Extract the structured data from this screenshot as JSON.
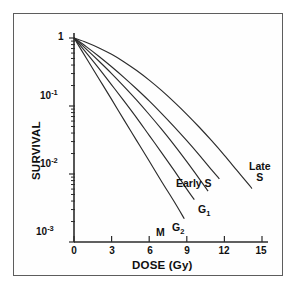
{
  "chart_data": {
    "type": "line",
    "title": "",
    "xlabel": "DOSE (Gy)",
    "ylabel": "SURVIVAL",
    "xlim": [
      0,
      15.6
    ],
    "ylim": [
      0.001,
      1
    ],
    "yscale": "log",
    "xscale": "linear",
    "grid": false,
    "legend": "inline-annotations",
    "xticks": [
      "0",
      "3",
      "6",
      "9",
      "12",
      "15"
    ],
    "xtick_values": [
      0,
      3,
      6,
      9,
      12,
      15
    ],
    "yticks": [
      "1",
      "10-1",
      "10-2",
      "10-3"
    ],
    "ytick_values": [
      1,
      0.1,
      0.01,
      0.001
    ],
    "ytick_mantissa": [
      "1",
      "10",
      "10",
      "10"
    ],
    "ytick_exponent": [
      "",
      "-1",
      "-2",
      "-3"
    ],
    "series": [
      {
        "name": "M",
        "label": "M",
        "points": [
          {
            "x": 0.0,
            "y": 1.0
          },
          {
            "x": 1.0,
            "y": 0.5
          },
          {
            "x": 2.0,
            "y": 0.25
          },
          {
            "x": 3.0,
            "y": 0.125
          },
          {
            "x": 4.0,
            "y": 0.062
          },
          {
            "x": 5.0,
            "y": 0.031
          },
          {
            "x": 6.0,
            "y": 0.0155
          },
          {
            "x": 7.0,
            "y": 0.0077
          },
          {
            "x": 8.0,
            "y": 0.0039
          },
          {
            "x": 8.8,
            "y": 0.0022
          }
        ]
      },
      {
        "name": "G2",
        "label": "G2",
        "points": [
          {
            "x": 0.0,
            "y": 1.0
          },
          {
            "x": 1.0,
            "y": 0.6
          },
          {
            "x": 2.0,
            "y": 0.355
          },
          {
            "x": 3.0,
            "y": 0.205
          },
          {
            "x": 4.0,
            "y": 0.118
          },
          {
            "x": 5.0,
            "y": 0.067
          },
          {
            "x": 6.0,
            "y": 0.037
          },
          {
            "x": 7.0,
            "y": 0.0205
          },
          {
            "x": 8.0,
            "y": 0.0112
          },
          {
            "x": 9.0,
            "y": 0.006
          },
          {
            "x": 9.6,
            "y": 0.0042
          }
        ]
      },
      {
        "name": "G1",
        "label": "G1",
        "points": [
          {
            "x": 0.0,
            "y": 1.0
          },
          {
            "x": 1.0,
            "y": 0.68
          },
          {
            "x": 2.0,
            "y": 0.455
          },
          {
            "x": 3.0,
            "y": 0.3
          },
          {
            "x": 4.0,
            "y": 0.193
          },
          {
            "x": 5.0,
            "y": 0.122
          },
          {
            "x": 6.0,
            "y": 0.075
          },
          {
            "x": 7.0,
            "y": 0.0452
          },
          {
            "x": 8.0,
            "y": 0.0266
          },
          {
            "x": 9.0,
            "y": 0.0152
          },
          {
            "x": 10.0,
            "y": 0.0085
          },
          {
            "x": 10.7,
            "y": 0.0056
          }
        ]
      },
      {
        "name": "Early S",
        "label": "Early S",
        "points": [
          {
            "x": 0.0,
            "y": 1.0
          },
          {
            "x": 1.0,
            "y": 0.74
          },
          {
            "x": 2.0,
            "y": 0.535
          },
          {
            "x": 3.0,
            "y": 0.378
          },
          {
            "x": 4.0,
            "y": 0.262
          },
          {
            "x": 5.0,
            "y": 0.178
          },
          {
            "x": 6.0,
            "y": 0.119
          },
          {
            "x": 7.0,
            "y": 0.0775
          },
          {
            "x": 8.0,
            "y": 0.0495
          },
          {
            "x": 9.0,
            "y": 0.031
          },
          {
            "x": 10.0,
            "y": 0.019
          },
          {
            "x": 11.0,
            "y": 0.0114
          },
          {
            "x": 11.6,
            "y": 0.0085
          }
        ]
      },
      {
        "name": "Late S",
        "label": "Late S",
        "points": [
          {
            "x": 0.0,
            "y": 1.0
          },
          {
            "x": 1.0,
            "y": 0.86
          },
          {
            "x": 2.0,
            "y": 0.715
          },
          {
            "x": 3.0,
            "y": 0.575
          },
          {
            "x": 4.0,
            "y": 0.445
          },
          {
            "x": 5.0,
            "y": 0.332
          },
          {
            "x": 6.0,
            "y": 0.24
          },
          {
            "x": 7.0,
            "y": 0.168
          },
          {
            "x": 8.0,
            "y": 0.114
          },
          {
            "x": 9.0,
            "y": 0.0755
          },
          {
            "x": 10.0,
            "y": 0.0487
          },
          {
            "x": 11.0,
            "y": 0.0306
          },
          {
            "x": 12.0,
            "y": 0.0188
          },
          {
            "x": 13.0,
            "y": 0.0113
          },
          {
            "x": 14.0,
            "y": 0.0068
          },
          {
            "x": 14.2,
            "y": 0.0061
          }
        ]
      }
    ],
    "annotations": [
      {
        "text": "M",
        "x": 7.6,
        "y": 0.0016
      },
      {
        "text": "G2",
        "x": 9.1,
        "y": 0.0019
      },
      {
        "text": "G1",
        "x": 10.6,
        "y": 0.004
      },
      {
        "text": "Early S",
        "x": 11.0,
        "y": 0.007
      },
      {
        "text": "Late S",
        "x": 14.1,
        "y": 0.0058
      }
    ]
  },
  "axes": {
    "x_title": "DOSE (Gy)",
    "y_title": "SURVIVAL"
  },
  "labels": {
    "m": "M",
    "g2_base": "G",
    "g2_sub": "2",
    "g1_base": "G",
    "g1_sub": "1",
    "early_s": "Early S",
    "late_line1": "Late",
    "late_line2": "S"
  },
  "ytick_text": {
    "one": "1",
    "ten": "10",
    "exp1": "-1",
    "exp2": "-2",
    "exp3": "-3"
  },
  "xtick_text": {
    "t0": "0",
    "t3": "3",
    "t6": "6",
    "t9": "9",
    "t12": "12",
    "t15": "15"
  },
  "colors": {
    "curve": "#2b2b2b",
    "axis": "#2b2b2b",
    "frame": "#5d5d5d",
    "background": "#ffffff",
    "text": "#101010"
  }
}
